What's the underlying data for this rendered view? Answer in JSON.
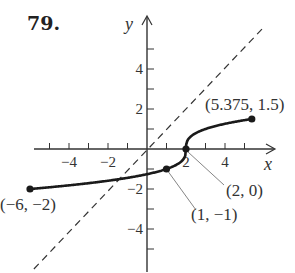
{
  "problem": {
    "number": "79."
  },
  "chart_data": {
    "type": "line",
    "title": "",
    "xlabel": "x",
    "ylabel": "y",
    "xlim": [
      -6.2,
      6.5
    ],
    "ylim": [
      -6,
      6
    ],
    "grid": false,
    "x_ticks": [
      -5,
      -4,
      -3,
      -2,
      -1,
      1,
      2,
      3,
      4,
      5
    ],
    "x_tick_labels": [
      {
        "value": -4,
        "label": "−4"
      },
      {
        "value": -2,
        "label": "−2"
      },
      {
        "value": 2,
        "label": "2"
      },
      {
        "value": 4,
        "label": "4"
      }
    ],
    "y_ticks": [
      -5,
      -4,
      -3,
      -2,
      -1,
      1,
      2,
      3,
      4,
      5
    ],
    "y_tick_labels": [
      {
        "value": 4,
        "label": "4"
      },
      {
        "value": 2,
        "label": "2"
      },
      {
        "value": -2,
        "label": "−2"
      },
      {
        "value": -4,
        "label": "−4"
      }
    ],
    "series": [
      {
        "name": "y = cbrt(x - 2)",
        "style": "solid",
        "domain": [
          -6,
          5.375
        ],
        "points": [
          {
            "x": -6,
            "y": -2
          },
          {
            "x": -4,
            "y": -1.817
          },
          {
            "x": -2,
            "y": -1.587
          },
          {
            "x": 0,
            "y": -1.26
          },
          {
            "x": 1,
            "y": -1
          },
          {
            "x": 1.5,
            "y": -0.794
          },
          {
            "x": 1.9,
            "y": -0.464
          },
          {
            "x": 2,
            "y": 0
          },
          {
            "x": 2.1,
            "y": 0.464
          },
          {
            "x": 2.5,
            "y": 0.794
          },
          {
            "x": 3,
            "y": 1
          },
          {
            "x": 4,
            "y": 1.26
          },
          {
            "x": 5.375,
            "y": 1.5
          }
        ]
      },
      {
        "name": "y = x",
        "style": "dashed",
        "points": [
          {
            "x": -5.8,
            "y": -6.0
          },
          {
            "x": 5.9,
            "y": 6.0
          }
        ]
      }
    ],
    "annotations": [
      {
        "label": "(−6, −2)",
        "x": -6,
        "y": -2,
        "marker": true
      },
      {
        "label": "(5.375, 1.5)",
        "x": 5.375,
        "y": 1.5,
        "marker": true
      },
      {
        "label": "(2, 0)",
        "x": 2,
        "y": 0,
        "marker": true,
        "leader": true
      },
      {
        "label": "(1, −1)",
        "x": 1,
        "y": -1,
        "marker": true,
        "leader": true
      }
    ]
  }
}
